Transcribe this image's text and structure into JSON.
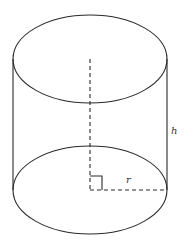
{
  "figure": {
    "type": "cylinder",
    "labels": {
      "height": "h",
      "radius": "r"
    },
    "colors": {
      "stroke": "#2a2a2a",
      "label": "#333333",
      "background": "#ffffff"
    },
    "geometry": {
      "center_x": 90,
      "top_ellipse_cy": 59,
      "bottom_ellipse_cy": 190,
      "rx": 77,
      "ry": 44
    }
  }
}
